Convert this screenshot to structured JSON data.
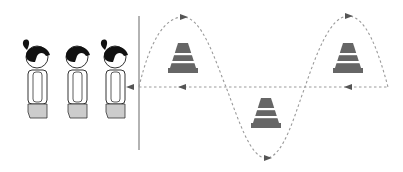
{
  "diagram": {
    "title": "Slalom relay around cones",
    "colors": {
      "background": "#ffffff",
      "line": "#8a8a8a",
      "path_dash": "#9a9a9a",
      "arrow": "#555555",
      "cone": "#666666",
      "cone_stripe": "#ffffff",
      "hair": "#111111",
      "shorts": "#cccccc",
      "outline": "#333333"
    },
    "start_line": {
      "x": 139,
      "y1": 16,
      "y2": 150,
      "icon": "start-line"
    },
    "return_path": {
      "y": 87,
      "x_start": 388,
      "x_end": 130,
      "direction": "left",
      "icon": "dashed-arrow-left"
    },
    "slalom_path": {
      "direction": "right",
      "icon": "dashed-sine-curve"
    },
    "cones": [
      {
        "id": "cone-1",
        "x": 183,
        "y": 58,
        "icon": "traffic-cone"
      },
      {
        "id": "cone-2",
        "x": 266,
        "y": 113,
        "icon": "traffic-cone"
      },
      {
        "id": "cone-3",
        "x": 348,
        "y": 58,
        "icon": "traffic-cone"
      }
    ],
    "children": [
      {
        "id": "child-1",
        "x": 37,
        "ponytail": true,
        "icon": "child-figure"
      },
      {
        "id": "child-2",
        "x": 77,
        "ponytail": false,
        "icon": "child-figure"
      },
      {
        "id": "child-3",
        "x": 115,
        "ponytail": true,
        "icon": "child-figure"
      }
    ]
  }
}
